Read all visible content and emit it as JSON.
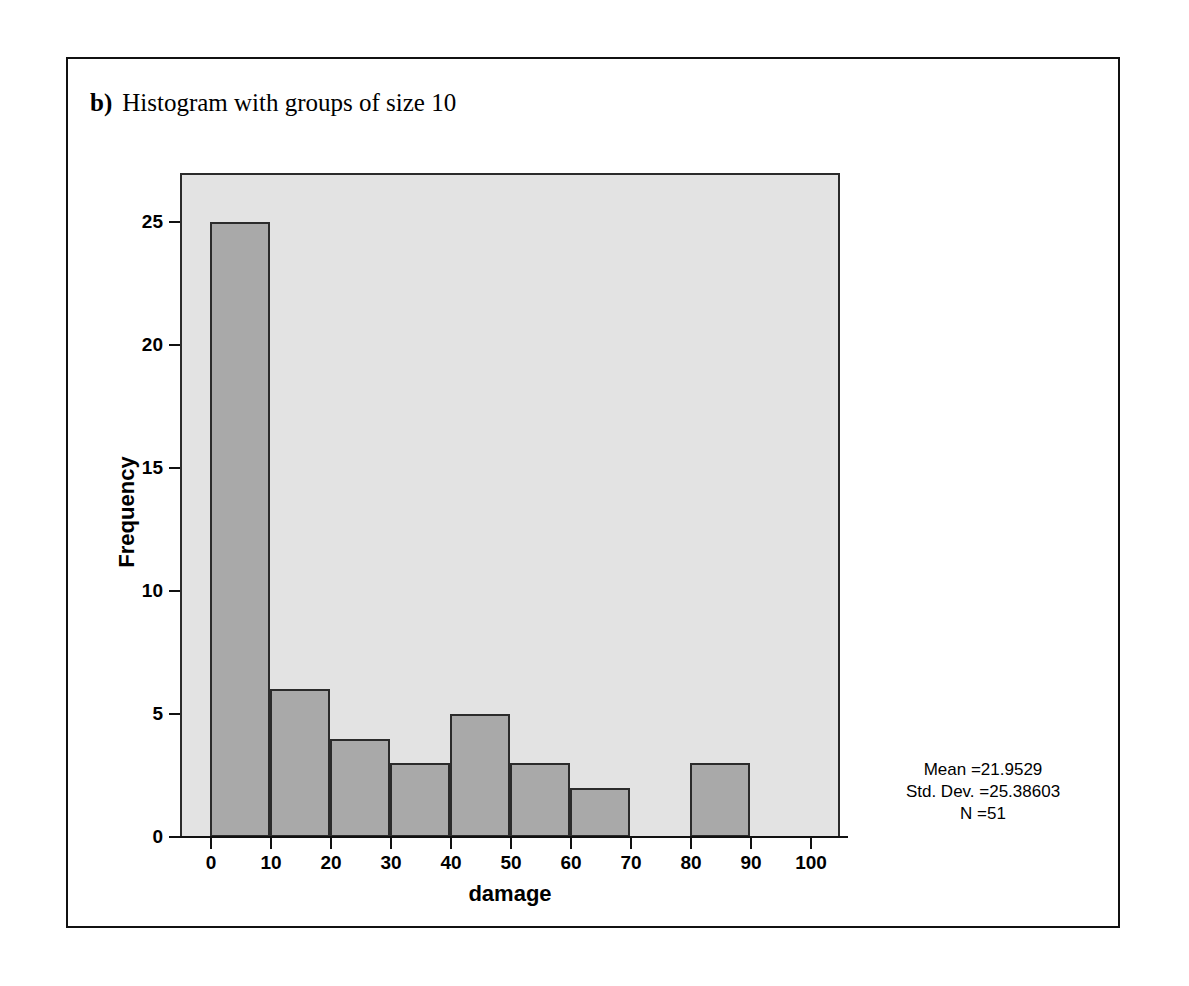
{
  "caption": {
    "letter": "b)",
    "text": "Histogram with groups of size 10"
  },
  "chart_data": {
    "type": "bar",
    "subtype": "histogram",
    "title": "",
    "xlabel": "damage",
    "ylabel": "Frequency",
    "bin_width": 10,
    "bin_edges": [
      0,
      10,
      20,
      30,
      40,
      50,
      60,
      70,
      80,
      90,
      100
    ],
    "categories": [
      "0-10",
      "10-20",
      "20-30",
      "30-40",
      "40-50",
      "50-60",
      "60-70",
      "70-80",
      "80-90",
      "90-100"
    ],
    "values": [
      25,
      6,
      4,
      3,
      5,
      3,
      2,
      0,
      3,
      0
    ],
    "xlim": [
      -5,
      105
    ],
    "ylim": [
      0,
      27
    ],
    "x_ticks": [
      "0",
      "10",
      "20",
      "30",
      "40",
      "50",
      "60",
      "70",
      "80",
      "90",
      "100"
    ],
    "x_tick_values": [
      0,
      10,
      20,
      30,
      40,
      50,
      60,
      70,
      80,
      90,
      100
    ],
    "y_ticks": [
      "0",
      "5",
      "10",
      "15",
      "20",
      "25"
    ],
    "y_tick_values": [
      0,
      5,
      10,
      15,
      20,
      25
    ],
    "grid": false,
    "legend": false,
    "bar_fill_color": "#a9a9a9",
    "bar_border_color": "#2b2b2b",
    "panel_background_color": "#e3e3e3"
  },
  "statistics": {
    "mean": "Mean =21.9529",
    "std_dev": "Std. Dev. =25.38603",
    "n": "N =51"
  }
}
